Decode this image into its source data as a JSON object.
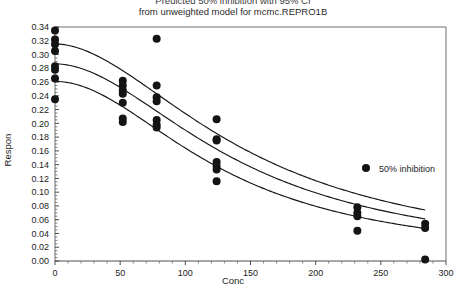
{
  "figure": {
    "title_lines": [
      "Predicted 50% inhibition with 95% CI",
      "from unweighted model for mcmc.REPRO1B"
    ]
  },
  "axes": {
    "x": {
      "name": "Conc",
      "ticks": [
        "0",
        "50",
        "100",
        "150",
        "200",
        "250",
        "300"
      ],
      "min": 0,
      "max": 300,
      "minor_step": 10
    },
    "y": {
      "name": "Respon",
      "ticks": [
        "0.34",
        "0.32",
        "0.30",
        "0.28",
        "0.26",
        "0.24",
        "0.22",
        "0.20",
        "0.18",
        "0.16",
        "0.14",
        "0.12",
        "0.10",
        "0.08",
        "0.06",
        "0.04",
        "0.02",
        "0.00"
      ],
      "min": 0.0,
      "max": 0.34,
      "minor_step": 0.005
    }
  },
  "legend": {
    "entries": [
      {
        "label": "50% inhibition",
        "marker": "filled-circle",
        "color": "#141414"
      }
    ]
  },
  "colors": {
    "marker": "#141414",
    "curve": "#141414",
    "frame": "#6e6e6e",
    "background": "#ffffff"
  },
  "chart_data": {
    "type": "scatter",
    "title": "Predicted 50% inhibition with 95% CI from unweighted model for mcmc.REPRO1B",
    "xlabel": "Conc",
    "ylabel": "Respon",
    "xlim": [
      0,
      300
    ],
    "ylim": [
      0.0,
      0.34
    ],
    "grid": false,
    "legend_position": "inside-right",
    "series": [
      {
        "name": "50% inhibition",
        "type": "scatter",
        "marker": "filled-circle",
        "points": [
          {
            "x": 0,
            "y": 0.335
          },
          {
            "x": 0,
            "y": 0.322
          },
          {
            "x": 0,
            "y": 0.315
          },
          {
            "x": 0,
            "y": 0.305
          },
          {
            "x": 0,
            "y": 0.283
          },
          {
            "x": 0,
            "y": 0.278
          },
          {
            "x": 0,
            "y": 0.265
          },
          {
            "x": 0,
            "y": 0.235
          },
          {
            "x": 52,
            "y": 0.262
          },
          {
            "x": 52,
            "y": 0.255
          },
          {
            "x": 52,
            "y": 0.248
          },
          {
            "x": 52,
            "y": 0.243
          },
          {
            "x": 52,
            "y": 0.23
          },
          {
            "x": 52,
            "y": 0.207
          },
          {
            "x": 52,
            "y": 0.202
          },
          {
            "x": 78,
            "y": 0.323
          },
          {
            "x": 78,
            "y": 0.255
          },
          {
            "x": 78,
            "y": 0.238
          },
          {
            "x": 78,
            "y": 0.232
          },
          {
            "x": 78,
            "y": 0.205
          },
          {
            "x": 78,
            "y": 0.198
          },
          {
            "x": 78,
            "y": 0.194
          },
          {
            "x": 124,
            "y": 0.206
          },
          {
            "x": 124,
            "y": 0.177
          },
          {
            "x": 124,
            "y": 0.175
          },
          {
            "x": 124,
            "y": 0.144
          },
          {
            "x": 124,
            "y": 0.138
          },
          {
            "x": 124,
            "y": 0.133
          },
          {
            "x": 124,
            "y": 0.116
          },
          {
            "x": 232,
            "y": 0.078
          },
          {
            "x": 232,
            "y": 0.07
          },
          {
            "x": 232,
            "y": 0.065
          },
          {
            "x": 232,
            "y": 0.044
          },
          {
            "x": 284,
            "y": 0.054
          },
          {
            "x": 284,
            "y": 0.048
          },
          {
            "x": 284,
            "y": 0.002
          }
        ]
      },
      {
        "name": "upper 95% CI",
        "type": "line",
        "curve": {
          "top": 0.3155,
          "bottom": 0.0,
          "ec50": 150,
          "hill": 1.85,
          "x_from": 0,
          "x_to": 284
        }
      },
      {
        "name": "fitted curve",
        "type": "line",
        "curve": {
          "top": 0.2865,
          "bottom": 0.0,
          "ec50": 143,
          "hill": 1.9,
          "x_from": 0,
          "x_to": 284
        }
      },
      {
        "name": "lower 95% CI",
        "type": "line",
        "curve": {
          "top": 0.261,
          "bottom": 0.0,
          "ec50": 131,
          "hill": 1.95,
          "x_from": 0,
          "x_to": 284
        }
      }
    ]
  }
}
